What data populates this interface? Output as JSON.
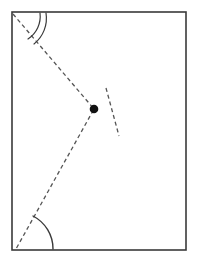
{
  "figure": {
    "background_color": "#ffffff",
    "stroke_color": "#3a3a3a",
    "dash_color": "#555555",
    "point_color": "#111111",
    "canvas": {
      "width": 200,
      "height": 263
    }
  },
  "chart_data": {
    "type": "diagram",
    "xlabel": "",
    "ylabel": "",
    "grid": false,
    "legend": false,
    "xlim": [
      0,
      200
    ],
    "ylim": [
      0,
      263
    ],
    "shapes": [
      {
        "name": "outer-rectangle",
        "kind": "rect",
        "x": 12,
        "y": 12,
        "width": 174,
        "height": 238,
        "stroke": "#3a3a3a",
        "stroke_width": 1.6,
        "fill": "none",
        "dashed": false
      },
      {
        "name": "long-dashed-diagonal",
        "kind": "line",
        "x1": 13,
        "y1": 14,
        "x2": 16,
        "y2": 249,
        "via_x": 94,
        "via_y": 109,
        "stroke": "#555555",
        "stroke_width": 1.3,
        "dashed": true,
        "dash_pattern": "4 3"
      },
      {
        "name": "short-dashed-crossing-line",
        "kind": "line",
        "x1": 106,
        "y1": 88,
        "x2": 119,
        "y2": 136,
        "stroke": "#555555",
        "stroke_width": 1.3,
        "dashed": true,
        "dash_pattern": "4 3"
      },
      {
        "name": "intersection-point",
        "kind": "dot",
        "cx": 94,
        "cy": 109,
        "r": 4.3,
        "fill": "#111111"
      },
      {
        "name": "top-left-angle-arc-outer",
        "kind": "arc",
        "cx": 13,
        "cy": 14,
        "radius": 33,
        "start_x": 46,
        "start_y": 13,
        "end_x": 34,
        "end_y": 44,
        "stroke": "#3a3a3a",
        "stroke_width": 1.2
      },
      {
        "name": "top-left-angle-arc-inner",
        "kind": "arc",
        "cx": 13,
        "cy": 14,
        "radius": 27,
        "start_x": 40,
        "start_y": 13,
        "end_x": 28,
        "end_y": 39,
        "stroke": "#3a3a3a",
        "stroke_width": 1.2
      },
      {
        "name": "bottom-left-angle-arc",
        "kind": "arc",
        "cx": 16,
        "cy": 249,
        "radius": 37,
        "start_x": 33,
        "start_y": 216,
        "end_x": 53,
        "end_y": 249,
        "stroke": "#3a3a3a",
        "stroke_width": 1.4
      }
    ],
    "annotations": [],
    "points": [
      {
        "name": "crossing-point",
        "x": 94,
        "y": 109,
        "label": ""
      }
    ]
  }
}
